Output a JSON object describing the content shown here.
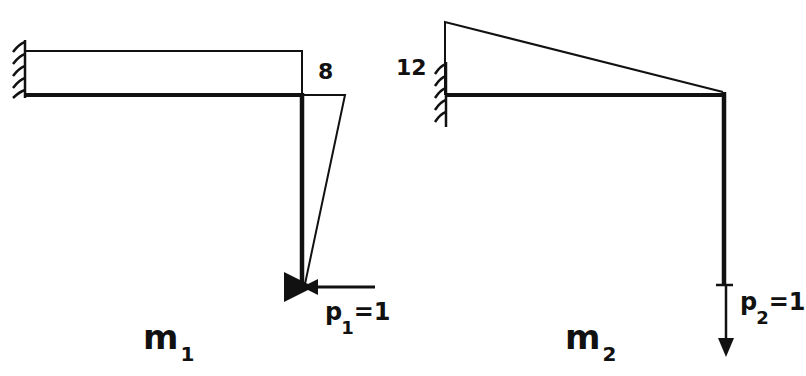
{
  "diagrams": [
    {
      "id": "m1",
      "label": {
        "main": "m",
        "subscript": "1"
      },
      "moment_value": "8",
      "load": {
        "symbol": "p",
        "subscript": "1",
        "equals": "=1",
        "direction": "horizontal-left"
      },
      "moment_diagram": "rectangle on beam, triangle on column",
      "support": "fixed-left"
    },
    {
      "id": "m2",
      "label": {
        "main": "m",
        "subscript": "2"
      },
      "moment_value": "12",
      "load": {
        "symbol": "p",
        "subscript": "2",
        "equals": "=1",
        "direction": "vertical-down"
      },
      "moment_diagram": "triangle on beam",
      "support": "fixed-left"
    }
  ],
  "colors": {
    "line": "#111111",
    "background": "#ffffff"
  }
}
